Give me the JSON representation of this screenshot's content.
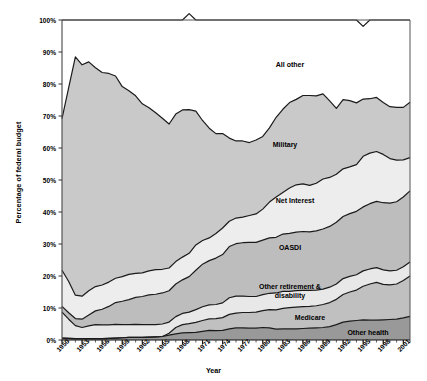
{
  "chart_data": {
    "type": "area",
    "stacked": true,
    "title": "",
    "xlabel": "Year",
    "ylabel": "Percentage of federal budget",
    "ylim": [
      0,
      100
    ],
    "ytick_labels": [
      "0%",
      "10%",
      "20%",
      "30%",
      "40%",
      "50%",
      "60%",
      "70%",
      "80%",
      "90%",
      "100%"
    ],
    "ytick_values": [
      0,
      10,
      20,
      30,
      40,
      50,
      60,
      70,
      80,
      90,
      100
    ],
    "xlim": [
      1950,
      2002
    ],
    "xtick_labels": [
      "1950",
      "1953",
      "1956",
      "1959",
      "1962",
      "1965",
      "1968",
      "1971",
      "1974",
      "1977",
      "1980",
      "1983",
      "1986",
      "1989",
      "1992",
      "1995",
      "1998",
      "2001"
    ],
    "xtick_values": [
      1950,
      1953,
      1956,
      1959,
      1962,
      1965,
      1968,
      1971,
      1974,
      1977,
      1980,
      1983,
      1986,
      1989,
      1992,
      1995,
      1998,
      2001
    ],
    "grid": false,
    "legend_position": "inline-labels",
    "x": [
      1950,
      1951,
      1952,
      1953,
      1954,
      1955,
      1956,
      1957,
      1958,
      1959,
      1960,
      1961,
      1962,
      1963,
      1964,
      1965,
      1966,
      1967,
      1968,
      1969,
      1970,
      1971,
      1972,
      1973,
      1974,
      1975,
      1976,
      1977,
      1978,
      1979,
      1980,
      1981,
      1982,
      1983,
      1984,
      1985,
      1986,
      1987,
      1988,
      1989,
      1990,
      1991,
      1992,
      1993,
      1994,
      1995,
      1996,
      1997,
      1998,
      1999,
      2000,
      2001,
      2002
    ],
    "series": [
      {
        "name": "Other health",
        "fill": "#999999",
        "values": [
          0.6,
          0.5,
          0.4,
          0.4,
          0.4,
          0.4,
          0.4,
          0.5,
          0.6,
          0.7,
          0.8,
          0.8,
          0.8,
          0.9,
          1.0,
          1.1,
          1.5,
          1.9,
          2.2,
          2.3,
          2.4,
          2.7,
          3.0,
          2.9,
          3.0,
          3.5,
          3.8,
          3.8,
          3.7,
          3.7,
          3.9,
          3.8,
          3.4,
          3.5,
          3.5,
          3.5,
          3.6,
          3.7,
          3.8,
          3.9,
          4.2,
          4.8,
          5.6,
          5.9,
          6.1,
          6.3,
          6.2,
          6.2,
          6.3,
          6.4,
          6.5,
          6.9,
          7.4
        ]
      },
      {
        "name": "Medicare",
        "fill": "#c0c0c0",
        "values": [
          0.0,
          0.0,
          0.0,
          0.0,
          0.0,
          0.0,
          0.0,
          0.0,
          0.0,
          0.0,
          0.0,
          0.0,
          0.0,
          0.0,
          0.0,
          0.0,
          0.6,
          2.0,
          2.6,
          2.8,
          3.1,
          3.4,
          3.6,
          3.8,
          4.0,
          4.5,
          4.6,
          4.8,
          4.9,
          5.0,
          5.3,
          5.7,
          6.0,
          6.4,
          6.6,
          6.8,
          6.8,
          6.8,
          6.9,
          7.2,
          7.5,
          7.9,
          8.6,
          9.1,
          9.5,
          10.5,
          11.3,
          11.8,
          11.1,
          10.8,
          11.0,
          11.7,
          12.6
        ]
      },
      {
        "name": "Other retirement & disability",
        "fill": "#e8e8e8",
        "values": [
          8.1,
          6.0,
          4.1,
          3.5,
          4.0,
          4.4,
          4.3,
          4.2,
          4.3,
          4.1,
          4.0,
          4.1,
          4.0,
          3.9,
          3.8,
          3.9,
          3.5,
          3.4,
          3.5,
          3.6,
          4.0,
          4.3,
          4.4,
          4.4,
          4.6,
          5.2,
          5.3,
          5.1,
          5.0,
          4.9,
          5.0,
          5.1,
          5.3,
          5.3,
          5.1,
          5.1,
          5.1,
          5.0,
          4.9,
          4.8,
          4.8,
          4.8,
          5.0,
          4.9,
          4.8,
          4.8,
          4.7,
          4.6,
          4.5,
          4.4,
          4.3,
          4.3,
          4.4
        ]
      },
      {
        "name": "OASDI",
        "fill": "#bdbdbd",
        "values": [
          1.8,
          2.0,
          2.2,
          2.6,
          3.4,
          4.3,
          4.9,
          5.8,
          6.8,
          7.3,
          7.8,
          8.4,
          8.8,
          9.3,
          9.5,
          9.7,
          9.8,
          10.2,
          10.5,
          11.1,
          12.3,
          13.3,
          13.8,
          14.5,
          15.1,
          16.0,
          16.4,
          16.7,
          16.9,
          16.9,
          17.0,
          17.3,
          17.4,
          17.9,
          18.1,
          18.3,
          18.4,
          18.3,
          18.5,
          18.8,
          19.0,
          19.3,
          19.4,
          19.6,
          19.8,
          20.0,
          20.4,
          20.7,
          21.0,
          21.2,
          21.4,
          21.8,
          22.2
        ]
      },
      {
        "name": "Net Interest",
        "fill": "#ededed",
        "values": [
          11.3,
          9.8,
          7.3,
          7.2,
          7.6,
          7.6,
          7.6,
          7.6,
          7.6,
          7.7,
          7.9,
          7.5,
          7.4,
          7.5,
          7.7,
          7.4,
          7.1,
          7.0,
          7.1,
          7.3,
          7.9,
          7.4,
          7.1,
          7.7,
          8.3,
          7.9,
          8.0,
          8.0,
          8.4,
          8.9,
          9.7,
          11.2,
          12.6,
          13.0,
          14.2,
          14.8,
          14.9,
          14.5,
          14.9,
          15.6,
          15.3,
          15.0,
          14.9,
          14.6,
          14.6,
          15.8,
          15.8,
          15.6,
          15.1,
          13.9,
          13.0,
          11.6,
          10.4
        ]
      },
      {
        "name": "Military",
        "fill": "#c9c9c9",
        "values": [
          47.4,
          60.6,
          74.5,
          72.3,
          71.5,
          68.4,
          66.4,
          65.2,
          63.2,
          59.4,
          57.4,
          55.5,
          52.8,
          51.0,
          49.0,
          47.2,
          45.0,
          46.1,
          46.0,
          44.9,
          41.8,
          37.5,
          34.3,
          31.2,
          29.5,
          26.0,
          24.1,
          23.8,
          22.8,
          23.1,
          22.7,
          23.2,
          24.9,
          26.0,
          26.7,
          26.7,
          27.6,
          28.1,
          27.3,
          26.6,
          23.9,
          20.6,
          21.6,
          20.7,
          19.3,
          17.9,
          17.0,
          16.9,
          16.2,
          16.2,
          16.5,
          16.4,
          17.3
        ]
      },
      {
        "name": "All other",
        "fill": "#ffffff",
        "values": [
          30.8,
          21.1,
          11.5,
          14.0,
          13.1,
          14.9,
          16.4,
          16.7,
          17.5,
          20.8,
          22.1,
          23.7,
          26.2,
          27.4,
          29.0,
          30.7,
          32.5,
          29.4,
          28.1,
          30.0,
          28.5,
          31.4,
          33.8,
          35.5,
          35.5,
          36.9,
          37.8,
          37.8,
          38.3,
          37.5,
          36.4,
          33.7,
          30.4,
          27.9,
          25.8,
          24.8,
          23.6,
          23.6,
          23.7,
          23.1,
          25.3,
          27.6,
          24.9,
          25.2,
          25.9,
          22.7,
          24.6,
          24.2,
          25.8,
          27.1,
          27.3,
          27.3,
          25.7
        ]
      }
    ],
    "series_label_positions": [
      {
        "name": "All other",
        "x": 290,
        "y": 60
      },
      {
        "name": "Military",
        "x": 285,
        "y": 140
      },
      {
        "name": "Net Interest",
        "x": 295,
        "y": 196
      },
      {
        "name": "OASDI",
        "x": 290,
        "y": 243
      },
      {
        "name": "Other retirement & disability",
        "x": 258,
        "y": 282
      },
      {
        "name": "Medicare",
        "x": 310,
        "y": 313
      },
      {
        "name": "Other health",
        "x": 368,
        "y": 328
      }
    ]
  }
}
